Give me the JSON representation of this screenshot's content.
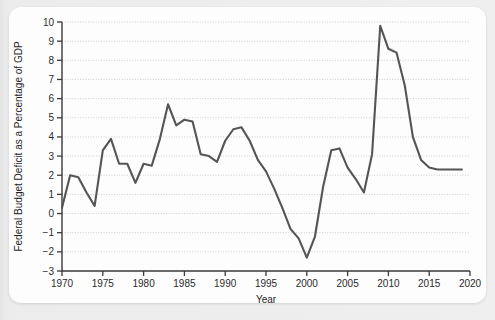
{
  "card": {
    "background_color": "#fdfdfd",
    "page_background_color": "#e9e9e9"
  },
  "chart_data": {
    "type": "line",
    "title": "",
    "xlabel": "Year",
    "ylabel": "Federal Budget Deficit as a Percentage of GDP",
    "xlim": [
      1970,
      2020
    ],
    "ylim": [
      -3,
      10
    ],
    "xticks": [
      1970,
      1975,
      1980,
      1985,
      1990,
      1995,
      2000,
      2005,
      2010,
      2015,
      2020
    ],
    "yticks": [
      -3,
      -2,
      -1,
      0,
      1,
      2,
      3,
      4,
      5,
      6,
      7,
      8,
      9,
      10
    ],
    "xtick_labels": [
      "1970",
      "1975",
      "1980",
      "1985",
      "1990",
      "1995",
      "2000",
      "2005",
      "2010",
      "2015",
      "2020"
    ],
    "ytick_labels": [
      "-3",
      "-2",
      "-1",
      "0",
      "1",
      "2",
      "3",
      "4",
      "5",
      "6",
      "7",
      "8",
      "9",
      "10"
    ],
    "grid": true,
    "grid_axis": "y",
    "legend": false,
    "line_color": "#555555",
    "series": [
      {
        "name": "Federal Budget Deficit as a Percentage of GDP",
        "x": [
          1970,
          1971,
          1972,
          1973,
          1974,
          1975,
          1976,
          1977,
          1978,
          1979,
          1980,
          1981,
          1982,
          1983,
          1984,
          1985,
          1986,
          1987,
          1988,
          1989,
          1990,
          1991,
          1992,
          1993,
          1994,
          1995,
          1996,
          1997,
          1998,
          1999,
          2000,
          2001,
          2002,
          2003,
          2004,
          2005,
          2006,
          2007,
          2008,
          2009,
          2010,
          2011,
          2012,
          2013,
          2014,
          2015,
          2016,
          2017,
          2018,
          2019
        ],
        "values": [
          0.3,
          2.0,
          1.9,
          1.1,
          0.4,
          3.3,
          3.9,
          2.6,
          2.6,
          1.6,
          2.6,
          2.5,
          3.9,
          5.7,
          4.6,
          4.9,
          4.8,
          3.1,
          3.0,
          2.7,
          3.8,
          4.4,
          4.5,
          3.8,
          2.8,
          2.2,
          1.3,
          0.3,
          -0.8,
          -1.3,
          -2.3,
          -1.2,
          1.4,
          3.3,
          3.4,
          2.4,
          1.8,
          1.1,
          3.1,
          9.8,
          8.6,
          8.4,
          6.7,
          4.0,
          2.8,
          2.4,
          2.3,
          2.3,
          2.3,
          2.3
        ]
      }
    ]
  }
}
